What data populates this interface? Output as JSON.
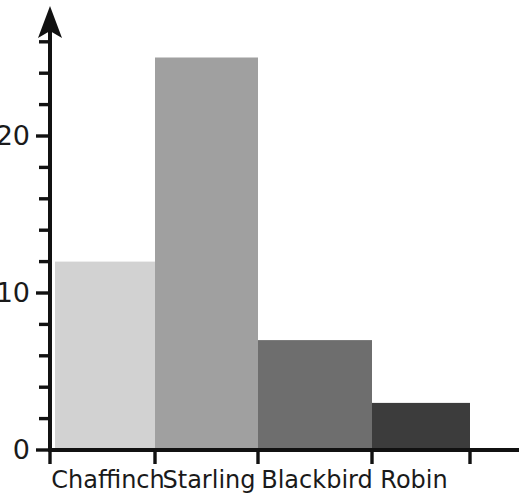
{
  "chart_data": {
    "type": "bar",
    "title": "",
    "subtitle": "",
    "xlabel": "",
    "ylabel": "",
    "categories": [
      "Chaffinch",
      "Starling",
      "Blackbird",
      "Robin"
    ],
    "values": [
      12,
      25,
      7,
      3
    ],
    "series": [
      {
        "name": "Count",
        "values": [
          12,
          25,
          7,
          3
        ]
      }
    ],
    "bar_colors": [
      "#d2d2d2",
      "#a0a0a0",
      "#6e6e6e",
      "#3c3c3c"
    ],
    "ylim": [
      0,
      27
    ],
    "ytick_labels": [
      "0",
      "10",
      "20"
    ],
    "ytick_values": [
      0,
      10,
      20
    ],
    "yminor_tick_values": [
      2,
      4,
      6,
      8,
      12,
      14,
      16,
      18,
      22,
      24,
      26
    ],
    "ytick_step": 2,
    "grid": false,
    "legend": "none",
    "axis_color": "#111111",
    "y_axis_arrow": true,
    "x_axis_extends_past_last_bar": true,
    "bars_adjacent_no_gap": true
  },
  "axis": {
    "y_label_0": "0",
    "y_label_10": "10",
    "y_label_20": "20"
  },
  "xlabels": {
    "0": "Chaffinch",
    "1": "Starling",
    "2": "Blackbird",
    "3": "Robin"
  }
}
